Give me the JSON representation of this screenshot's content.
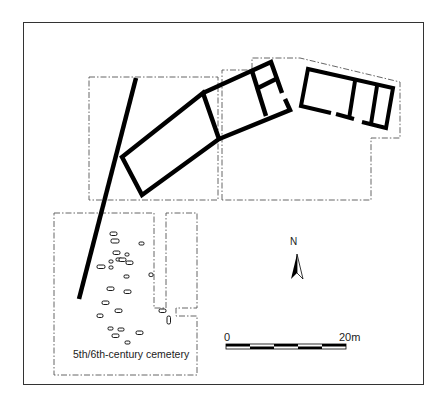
{
  "figure": {
    "type": "archaeological site plan",
    "frame": true
  },
  "labels": {
    "cemetery": "5th/6th-century cemetery",
    "north": "N"
  },
  "scale_bar": {
    "start_label": "0",
    "end_label": "20m",
    "segments": 5
  },
  "colors": {
    "wall": "#000000",
    "excavation_outline": "#555555",
    "frame": "#333333",
    "background": "#ffffff"
  },
  "legend_elements": [
    "excavated-area-outline",
    "building-walls",
    "boundary-wall",
    "graves",
    "north-arrow",
    "scale-bar"
  ]
}
